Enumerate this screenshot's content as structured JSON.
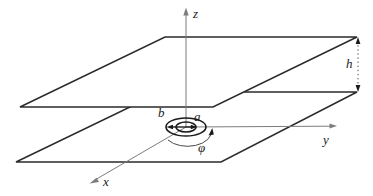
{
  "figure": {
    "background": "#ffffff",
    "labels": {
      "z_axis": "z",
      "y_axis": "y",
      "x_axis": "x",
      "plate_separation": "h",
      "inner_radius": "a",
      "outer_radius": "b",
      "azimuth_angle": "φ"
    },
    "colors": {
      "plate_stroke": "#2b2b2b",
      "axis_stroke": "#7d7d7d",
      "annotation_stroke": "#1a1a1a",
      "plate_fill": "#ffffff"
    }
  }
}
